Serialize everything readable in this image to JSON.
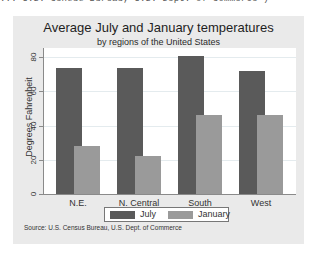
{
  "top_snippet": "... U.S. Census Bureau, U.S. Dept. of Commerce\")",
  "chart_data": {
    "type": "bar",
    "title": "Average July and January temperatures",
    "subtitle": "by regions of the United States",
    "categories": [
      "N.E.",
      "N. Central",
      "South",
      "West"
    ],
    "series": [
      {
        "name": "July",
        "values": [
          73.5,
          73.3,
          80.7,
          72.0
        ],
        "color": "#5a5a5a"
      },
      {
        "name": "January",
        "values": [
          28.3,
          22.0,
          46.3,
          46.2
        ],
        "color": "#9a9a9a"
      }
    ],
    "xlabel": "",
    "ylabel": "Degrees Fahrenheit",
    "yticks": [
      0,
      20,
      40,
      60,
      80
    ],
    "ylim": [
      0,
      85
    ],
    "grid": true,
    "legend_position": "bottom",
    "note": "Source: U.S. Census Bureau, U.S. Dept. of Commerce"
  },
  "legend": {
    "items": [
      {
        "label": "July"
      },
      {
        "label": "January"
      }
    ]
  }
}
